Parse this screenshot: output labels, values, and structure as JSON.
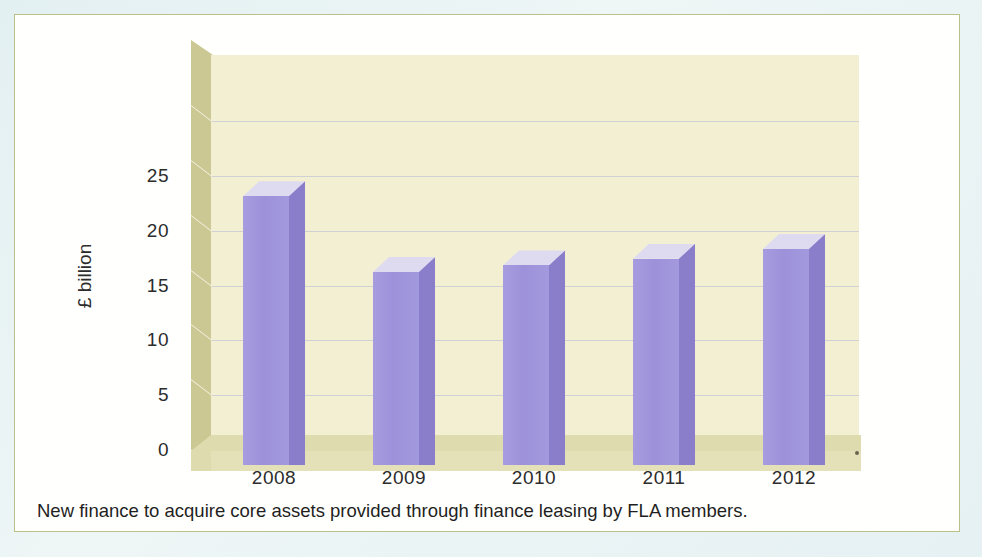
{
  "chart_data": {
    "type": "bar",
    "title": "",
    "subtitle": "",
    "xlabel": "",
    "ylabel": "£ billion",
    "categories": [
      "2008",
      "2009",
      "2010",
      "2011",
      "2012"
    ],
    "values": [
      24.5,
      17.6,
      18.2,
      18.8,
      19.7
    ],
    "series": [
      {
        "name": "New finance for core assets",
        "values": [
          24.5,
          17.6,
          18.2,
          18.8,
          19.7
        ]
      }
    ],
    "ylim": [
      0,
      30
    ],
    "yticks": [
      "0",
      "5",
      "10",
      "15",
      "20",
      "25"
    ],
    "ytick_values": [
      0,
      5,
      10,
      15,
      20,
      25
    ],
    "gridlines": [
      5,
      10,
      15,
      20,
      25,
      30
    ],
    "grid": true,
    "legend": "none",
    "style": "3d-column",
    "units": "£ billion"
  },
  "caption": {
    "text": "New finance to acquire core assets provided through finance leasing by FLA members."
  },
  "colors": {
    "bar_front": "#9d92da",
    "bar_side": "#8a7ecb",
    "bar_top": "#dedbf1",
    "panel_back": "#f3efd2",
    "wall_left": "#cbc894",
    "floor": "#dedbae",
    "gridline": "#c9cbd6",
    "card_border": "#b9c189",
    "page_background": "#e3f0f2",
    "text": "#2c2c2c"
  }
}
